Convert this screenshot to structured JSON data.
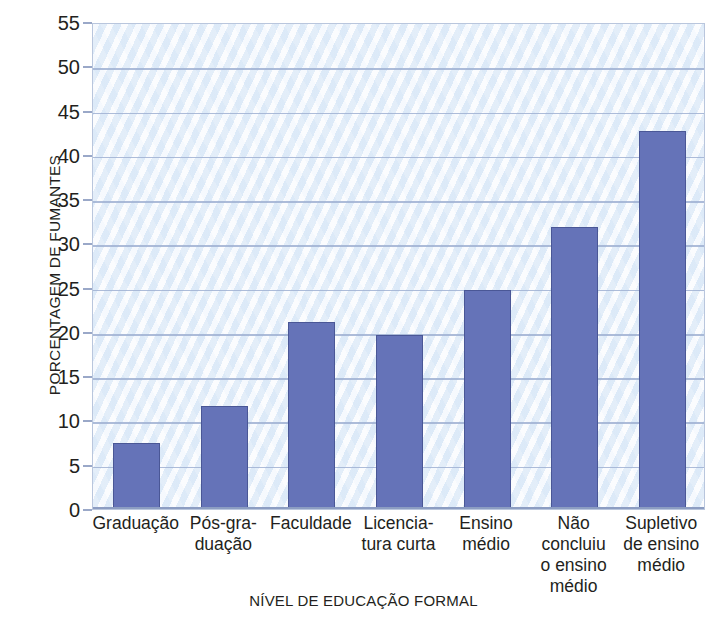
{
  "chart_data": {
    "type": "bar",
    "title": "",
    "xlabel": "NÍVEL DE EDUCAÇÃO FORMAL",
    "ylabel": "PORCENTAGEM DE FUMANTES",
    "categories": [
      "Graduação",
      "Pós-gra-\nduação",
      "Faculdade",
      "Licencia-\ntura curta",
      "Ensino\nmédio",
      "Não\nconcluiu\no ensino\nmédio",
      "Supletivo\nde ensino\nmédio"
    ],
    "values": [
      7.5,
      11.6,
      21.1,
      19.7,
      24.7,
      31.8,
      42.7
    ],
    "ylim": [
      0,
      55
    ],
    "ytick_step": 5,
    "yticks": [
      0,
      5,
      10,
      15,
      20,
      25,
      30,
      35,
      40,
      45,
      50,
      55
    ],
    "ytick_labels": [
      "0",
      "5",
      "10",
      "15",
      "20",
      "25",
      "30",
      "35",
      "40",
      "45",
      "50",
      "55"
    ],
    "grid": true,
    "legend": false,
    "series": [
      {
        "name": "Porcentagem de fumantes",
        "values": [
          7.5,
          11.6,
          21.1,
          19.7,
          24.7,
          31.8,
          42.7
        ]
      }
    ],
    "colors": {
      "bar_fill": "#6573b8",
      "bar_stroke": "#4a5796",
      "plot_background": "#e9f1fb",
      "gridline": "#9fb0d2",
      "axis_line": "#b9c6dd",
      "text": "#231f20"
    }
  }
}
